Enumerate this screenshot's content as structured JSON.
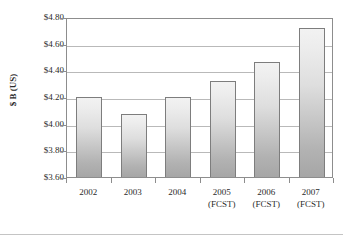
{
  "chart_data": {
    "type": "bar",
    "title": "",
    "subtitle": "",
    "xlabel": "",
    "ylabel": "$ B (US)",
    "categories": [
      "2002",
      "2003",
      "2004",
      "2005",
      "2006",
      "2007"
    ],
    "category_sublabels": [
      "",
      "",
      "",
      "(FCST)",
      "(FCST)",
      "(FCST)"
    ],
    "values": [
      4.2,
      4.07,
      4.2,
      4.32,
      4.46,
      4.72
    ],
    "ylim": [
      3.6,
      4.8
    ],
    "ytick_values": [
      4.8,
      4.6,
      4.4,
      4.2,
      4.0,
      3.8,
      3.6
    ],
    "ytick_labels": [
      "$4.80",
      "$4.60",
      "$4.40",
      "$4.20",
      "$4.00",
      "$3.80",
      "$3.60"
    ],
    "grid": true,
    "legend": false,
    "legend_position": "none",
    "series": [
      {
        "name": "$ B (US)",
        "values": [
          4.2,
          4.07,
          4.2,
          4.32,
          4.46,
          4.72
        ]
      }
    ],
    "annotations": []
  },
  "style": {
    "bar_fill_top": "#f2f2f2",
    "bar_fill_bottom": "#a6a6a6",
    "bar_border": "#7d7d7d",
    "gridline_color": "#b9b9b9",
    "frame_color": "#8d8d8d",
    "text_color": "#2b2b2b",
    "background": "#ffffff"
  }
}
